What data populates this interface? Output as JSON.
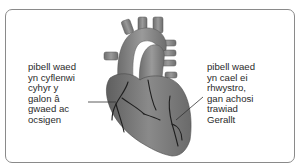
{
  "diagram": {
    "labels": {
      "left": "pibell waed\nyn cyflenwi\ncyhyr y\ngalon â\ngwaed ac\nocsigen",
      "right": "pibell waed\nyn cael ei\nrhwystro,\ngan achosi\ntrawiad\nGerallt"
    },
    "colors": {
      "frame_border": "#8a8a8a",
      "heart_fill": "#7d7d7d",
      "vessel_fill": "#8e8e8e",
      "artery_lines": "#1e1e1e",
      "text": "#2a2a2a"
    }
  }
}
